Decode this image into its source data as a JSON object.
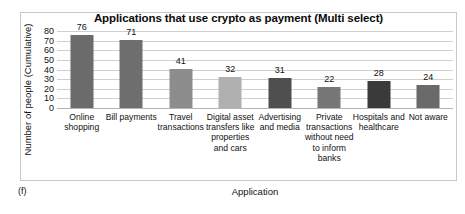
{
  "figure": {
    "tag": "(f)"
  },
  "chart_data": {
    "type": "bar",
    "title": "Applications that use crypto as payment (Multi select)",
    "xlabel": "Application",
    "ylabel": "Number of people (Cumulative)",
    "ylim": [
      0,
      80
    ],
    "yticks": [
      80,
      70,
      60,
      50,
      40,
      30,
      20,
      10,
      0
    ],
    "grid": true,
    "legend": "none",
    "categories": [
      "Online shopping",
      "Bill payments",
      "Travel transactions",
      "Digital asset transfers like properties and cars",
      "Advertising and media",
      "Private transactions without need to inform banks",
      "Hospitals and healthcare",
      "Not aware"
    ],
    "values": [
      76,
      71,
      41,
      32,
      31,
      22,
      28,
      24
    ],
    "bar_colors": [
      "#6b6b6b",
      "#6e6e6e",
      "#8d8d8d",
      "#b0b0b0",
      "#4f4f4f",
      "#777777",
      "#3a3a3a",
      "#6a6a6a"
    ]
  }
}
